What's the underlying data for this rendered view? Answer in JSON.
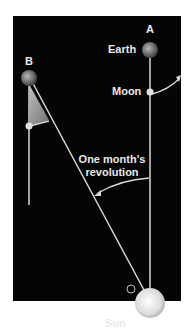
{
  "diagram": {
    "labels": {
      "point_a": "A",
      "point_b": "B",
      "earth": "Earth",
      "moon": "Moon",
      "sun": "Sun",
      "revolution_line1": "One month's",
      "revolution_line2": "revolution"
    },
    "colors": {
      "background": "#050505",
      "lines": "#d8d8d8",
      "text": "#e8e8e8",
      "wedge": "#9a9a9a",
      "sun": "#e6e6e6"
    }
  }
}
